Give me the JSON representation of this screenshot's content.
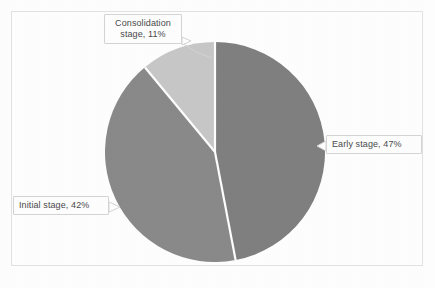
{
  "figure": {
    "background_color": "#ffffff",
    "frame_color": "#e3e3e3",
    "caption": ""
  },
  "labels": {
    "consolidation": "Consolidation\nstage, 11%",
    "early": "Early stage, 47%",
    "initial": "Initial stage, 42%"
  },
  "chart_data": {
    "type": "pie",
    "title": "",
    "subtitle": "",
    "xlabel": "",
    "ylabel": "",
    "grid": false,
    "legend_position": "none",
    "labels_position": "callout-boxes-outside",
    "start_angle_deg": 0,
    "direction": "clockwise",
    "units": "percent",
    "total": 100,
    "categories": [
      "Early stage",
      "Initial stage",
      "Consolidation stage"
    ],
    "values": [
      47,
      42,
      11
    ],
    "data_labels": [
      "Early stage, 47%",
      "Initial stage, 42%",
      "Consolidation stage, 11%"
    ],
    "colors": [
      "#808080",
      "#8a8a8a",
      "#c8c8c8"
    ],
    "slice_border_color": "#ffffff",
    "slices": [
      {
        "name": "Early stage",
        "value": 47,
        "label": "Early stage, 47%",
        "color": "#808080",
        "start_angle_deg": 0,
        "end_angle_deg": 169.2
      },
      {
        "name": "Initial stage",
        "value": 42,
        "label": "Initial stage, 42%",
        "color": "#8a8a8a",
        "start_angle_deg": 169.2,
        "end_angle_deg": 320.4
      },
      {
        "name": "Consolidation stage",
        "value": 11,
        "label": "Consolidation stage, 11%",
        "color": "#c8c8c8",
        "start_angle_deg": 320.4,
        "end_angle_deg": 360
      }
    ]
  }
}
